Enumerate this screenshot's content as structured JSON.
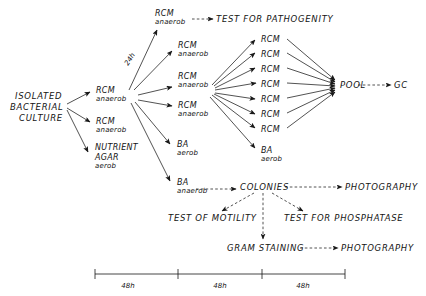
{
  "figure": {
    "type": "flow-diagram",
    "background_color": "#ffffff",
    "line_color": "#181818",
    "text_color": "#141414"
  },
  "nodes": {
    "source": {
      "line1": "ISOLATED",
      "line2": "BACTERIAL",
      "line3": "CULTURE"
    },
    "stage1": [
      {
        "id": "s1-rcm-main",
        "name": "RCM",
        "condition": "anaerob"
      },
      {
        "id": "s1-rcm-second",
        "name": "RCM",
        "condition": "anaerob"
      },
      {
        "id": "s1-nutrient-agar",
        "name": "NUTRIENT",
        "name2": "AGAR",
        "condition": "aerob"
      }
    ],
    "stage2": [
      {
        "id": "s2-rcm-top-pathogenity",
        "name": "RCM",
        "condition": "anaerob"
      },
      {
        "id": "s2-rcm-a",
        "name": "RCM",
        "condition": "anaerob"
      },
      {
        "id": "s2-rcm-hub",
        "name": "RCM",
        "condition": "anaerob"
      },
      {
        "id": "s2-rcm-c",
        "name": "RCM",
        "condition": "anaerob"
      },
      {
        "id": "s2-ba-aerob",
        "name": "BA",
        "condition": "aerob"
      },
      {
        "id": "s2-ba-anaerob",
        "name": "BA",
        "condition": "anaerob"
      }
    ],
    "stage3": {
      "rcm_replicates": [
        "RCM",
        "RCM",
        "RCM",
        "RCM",
        "RCM",
        "RCM",
        "RCM"
      ],
      "rcm_replicate_count": 7,
      "ba": {
        "name": "BA",
        "condition": "aerob"
      }
    },
    "pool": "POOL",
    "gc": "GC",
    "test_pathogenity": "TEST FOR PATHOGENITY",
    "colonies": "COLONIES",
    "photography_top": "PHOTOGRAPHY",
    "test_motility": "TEST OF MOTILITY",
    "test_phosphatase": "TEST FOR PHOSPHATASE",
    "gram_staining": "GRAM STAINING",
    "photography_bottom": "PHOTOGRAPHY"
  },
  "edge_labels": {
    "incubation_24h": "24h"
  },
  "timeline": {
    "segments": [
      {
        "label": "48h"
      },
      {
        "label": "48h"
      },
      {
        "label": "48h"
      }
    ]
  }
}
